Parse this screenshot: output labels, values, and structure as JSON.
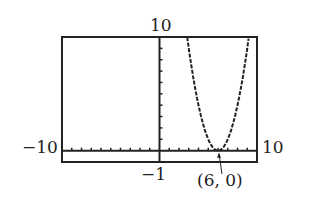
{
  "chart_data": {
    "type": "line",
    "title": "",
    "function": "y = (x - 6)^2",
    "xlim": [
      -10,
      10
    ],
    "ylim": [
      -1,
      10
    ],
    "xlabel": "",
    "ylabel": "",
    "grid": false,
    "tick_labels": {
      "xmin": "−10",
      "xmax": "10",
      "ymax": "10",
      "ymin": "−1"
    },
    "annotations": [
      {
        "text": "(6, 0)",
        "x": 6,
        "y": 0,
        "arrow": true
      }
    ],
    "series": [
      {
        "name": "parabola",
        "x": [
          2.84,
          3,
          4,
          5,
          6,
          7,
          8,
          9,
          9.16
        ],
        "y": [
          10,
          9,
          4,
          1,
          0,
          1,
          4,
          9,
          10
        ]
      }
    ]
  },
  "labels": {
    "xmin": "−10",
    "xmax": "10",
    "ymax": "10",
    "ymin": "−1",
    "point": "(6, 0)"
  },
  "colors": {
    "ink": "#222222",
    "background": "#ffffff"
  }
}
